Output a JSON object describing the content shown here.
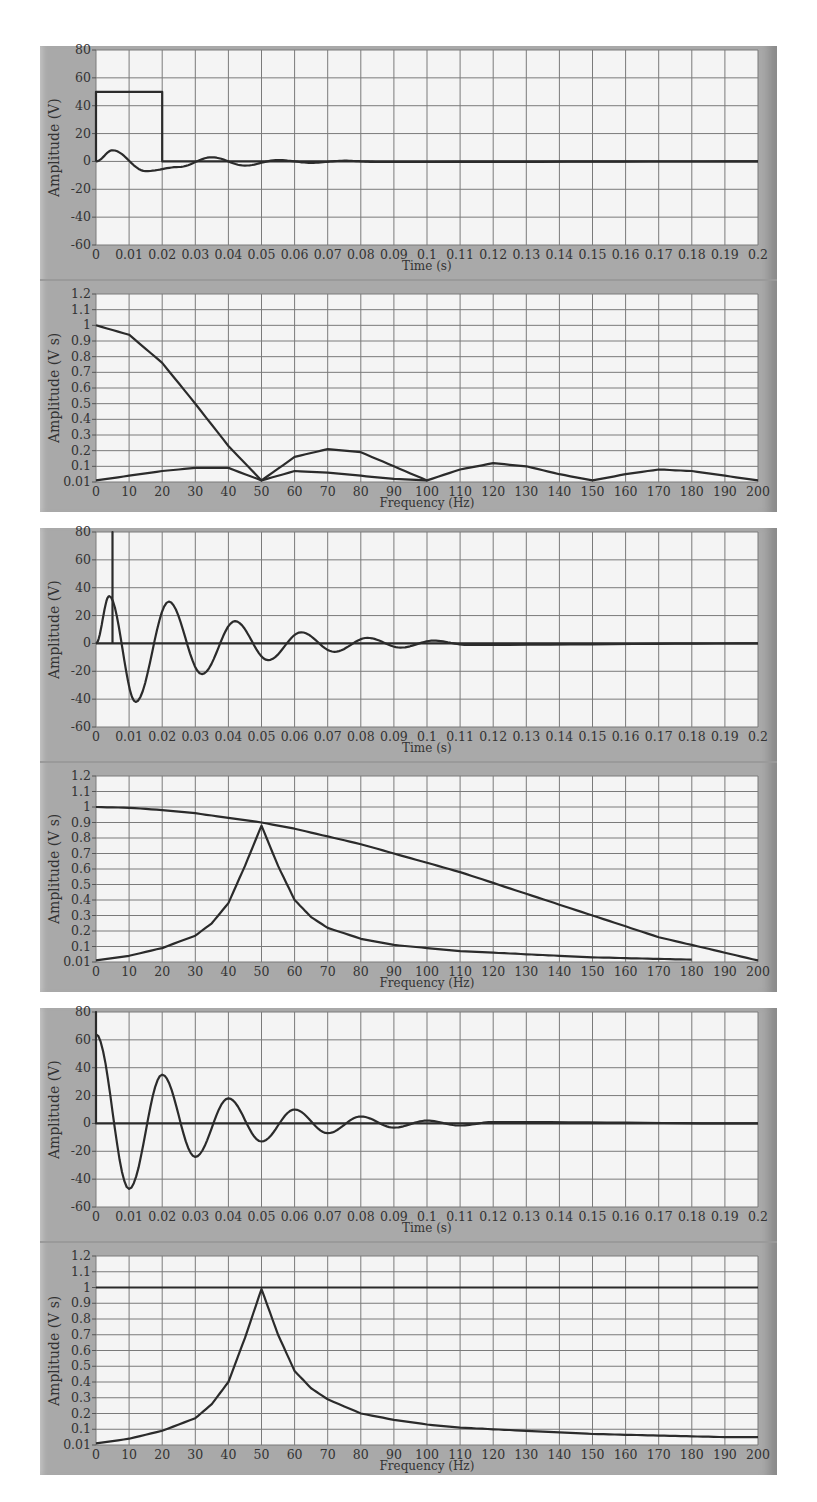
{
  "figure": {
    "panels": [
      {
        "id": "rect-pulse"
      },
      {
        "id": "impulse-response"
      },
      {
        "id": "matched"
      }
    ]
  },
  "chart_data": [
    {
      "type": "line",
      "panel": 1,
      "title": "",
      "xlabel": "Time (s)",
      "ylabel": "Amplitude (V)",
      "xlim": [
        0,
        0.2
      ],
      "ylim": [
        -60,
        80
      ],
      "xticks": [
        "0",
        "0.01",
        "0.02",
        "0.03",
        "0.04",
        "0.05",
        "0.06",
        "0.07",
        "0.08",
        "0.09",
        "0.1",
        "0.11",
        "0.12",
        "0.13",
        "0.14",
        "0.15",
        "0.16",
        "0.17",
        "0.18",
        "0.19",
        "0.2"
      ],
      "yticks": [
        "80",
        "60",
        "40",
        "20",
        "0",
        "-20",
        "-40",
        "-60"
      ],
      "grid": true,
      "series": [
        {
          "name": "rectangular pulse",
          "x": [
            0,
            0,
            0.02,
            0.02,
            0.2
          ],
          "values": [
            0,
            50,
            50,
            0,
            0
          ]
        },
        {
          "name": "decaying oscillation",
          "x": [
            0,
            0.005,
            0.015,
            0.025,
            0.035,
            0.045,
            0.055,
            0.065,
            0.075,
            0.085,
            0.2
          ],
          "values": [
            0,
            8,
            -7,
            -4,
            3,
            -3,
            1,
            -1,
            0.5,
            -0.4,
            0
          ]
        }
      ]
    },
    {
      "type": "line",
      "panel": 1,
      "xlabel": "Frequency (Hz)",
      "ylabel": "Amplitude (V s)",
      "xlim": [
        0,
        200
      ],
      "ylim": [
        0.01,
        1.2
      ],
      "xticks": [
        "0",
        "10",
        "20",
        "30",
        "40",
        "50",
        "60",
        "70",
        "80",
        "90",
        "100",
        "110",
        "120",
        "130",
        "140",
        "150",
        "160",
        "170",
        "180",
        "190",
        "200"
      ],
      "yticks": [
        "1.2",
        "1.1",
        "1",
        "0.9",
        "0.8",
        "0.7",
        "0.6",
        "0.5",
        "0.4",
        "0.3",
        "0.2",
        "0.1",
        "0.01"
      ],
      "grid": true,
      "series": [
        {
          "name": "pulse spectrum |sinc|",
          "x": [
            0,
            10,
            20,
            30,
            40,
            50,
            60,
            70,
            80,
            90,
            100,
            110,
            120,
            130,
            140,
            150,
            160,
            170,
            180,
            190,
            200
          ],
          "values": [
            1,
            0.94,
            0.76,
            0.5,
            0.23,
            0.01,
            0.16,
            0.21,
            0.19,
            0.1,
            0.01,
            0.08,
            0.12,
            0.1,
            0.05,
            0.01,
            0.05,
            0.08,
            0.07,
            0.04,
            0.01
          ]
        },
        {
          "name": "oscillation spectrum",
          "x": [
            0,
            10,
            20,
            30,
            40,
            50,
            60,
            70,
            80,
            90,
            100
          ],
          "values": [
            0.01,
            0.04,
            0.07,
            0.09,
            0.09,
            0.01,
            0.07,
            0.06,
            0.04,
            0.02,
            0.01
          ]
        }
      ]
    },
    {
      "type": "line",
      "panel": 2,
      "xlabel": "Time (s)",
      "ylabel": "Amplitude (V)",
      "xlim": [
        0,
        0.2
      ],
      "ylim": [
        -60,
        80
      ],
      "xticks": [
        "0",
        "0.01",
        "0.02",
        "0.03",
        "0.04",
        "0.05",
        "0.06",
        "0.07",
        "0.08",
        "0.09",
        "0.1",
        "0.11",
        "0.12",
        "0.13",
        "0.14",
        "0.15",
        "0.16",
        "0.17",
        "0.18",
        "0.19",
        "0.2"
      ],
      "yticks": [
        "80",
        "60",
        "40",
        "20",
        "0",
        "-20",
        "-40",
        "-60"
      ],
      "grid": true,
      "series": [
        {
          "name": "short pulse",
          "x": [
            0,
            0.005,
            0.005,
            0.005,
            0.2
          ],
          "values": [
            0,
            0,
            80,
            0,
            0
          ]
        },
        {
          "name": "decaying oscillation",
          "x": [
            0,
            0.004,
            0.012,
            0.022,
            0.032,
            0.042,
            0.052,
            0.062,
            0.072,
            0.082,
            0.092,
            0.102,
            0.112,
            0.2
          ],
          "values": [
            0,
            34,
            -42,
            30,
            -22,
            16,
            -12,
            8,
            -6,
            4,
            -3,
            2,
            -1,
            0
          ]
        }
      ]
    },
    {
      "type": "line",
      "panel": 2,
      "xlabel": "Frequency (Hz)",
      "ylabel": "Amplitude (V s)",
      "xlim": [
        0,
        200
      ],
      "ylim": [
        0.01,
        1.2
      ],
      "xticks": [
        "0",
        "10",
        "20",
        "30",
        "40",
        "50",
        "60",
        "70",
        "80",
        "90",
        "100",
        "110",
        "120",
        "130",
        "140",
        "150",
        "160",
        "170",
        "180",
        "190",
        "200"
      ],
      "yticks": [
        "1.2",
        "1.1",
        "1",
        "0.9",
        "0.8",
        "0.7",
        "0.6",
        "0.5",
        "0.4",
        "0.3",
        "0.2",
        "0.1",
        "0.01"
      ],
      "grid": true,
      "series": [
        {
          "name": "pulse spectrum",
          "x": [
            0,
            10,
            20,
            30,
            40,
            50,
            60,
            70,
            80,
            90,
            100,
            110,
            120,
            130,
            140,
            150,
            160,
            170,
            180,
            190,
            200
          ],
          "values": [
            1,
            0.995,
            0.98,
            0.96,
            0.93,
            0.9,
            0.86,
            0.81,
            0.76,
            0.7,
            0.64,
            0.58,
            0.51,
            0.44,
            0.37,
            0.3,
            0.23,
            0.16,
            0.11,
            0.06,
            0.01
          ]
        },
        {
          "name": "oscillation spectrum",
          "x": [
            0,
            10,
            20,
            30,
            35,
            40,
            45,
            50,
            55,
            60,
            65,
            70,
            80,
            90,
            100,
            110,
            120,
            130,
            140,
            150,
            160,
            170,
            180
          ],
          "values": [
            0.01,
            0.04,
            0.09,
            0.17,
            0.25,
            0.38,
            0.62,
            0.88,
            0.62,
            0.4,
            0.29,
            0.22,
            0.15,
            0.11,
            0.09,
            0.07,
            0.06,
            0.05,
            0.04,
            0.03,
            0.025,
            0.02,
            0.015
          ]
        }
      ]
    },
    {
      "type": "line",
      "panel": 3,
      "xlabel": "Time (s)",
      "ylabel": "Amplitude (V)",
      "xlim": [
        0,
        0.2
      ],
      "ylim": [
        -60,
        80
      ],
      "xticks": [
        "0",
        "0.01",
        "0.02",
        "0.03",
        "0.04",
        "0.05",
        "0.06",
        "0.07",
        "0.08",
        "0.09",
        "0.1",
        "0.11",
        "0.12",
        "0.13",
        "0.14",
        "0.15",
        "0.16",
        "0.17",
        "0.18",
        "0.19",
        "0.2"
      ],
      "yticks": [
        "80",
        "60",
        "40",
        "20",
        "0",
        "-20",
        "-40",
        "-60"
      ],
      "grid": true,
      "series": [
        {
          "name": "impulse",
          "x": [
            0,
            0,
            0,
            0.2
          ],
          "values": [
            0,
            80,
            0,
            0
          ]
        },
        {
          "name": "decaying oscillation",
          "x": [
            0,
            0.01,
            0.02,
            0.03,
            0.04,
            0.05,
            0.06,
            0.07,
            0.08,
            0.09,
            0.1,
            0.11,
            0.12,
            0.2
          ],
          "values": [
            64,
            -47,
            35,
            -24,
            18,
            -13,
            10,
            -7,
            5,
            -3,
            2,
            -1.5,
            1,
            0
          ]
        }
      ]
    },
    {
      "type": "line",
      "panel": 3,
      "xlabel": "Frequency (Hz)",
      "ylabel": "Amplitude (V s)",
      "xlim": [
        0,
        200
      ],
      "ylim": [
        0.01,
        1.2
      ],
      "xticks": [
        "0",
        "10",
        "20",
        "30",
        "40",
        "50",
        "60",
        "70",
        "80",
        "90",
        "100",
        "110",
        "120",
        "130",
        "140",
        "150",
        "160",
        "170",
        "180",
        "190",
        "200"
      ],
      "yticks": [
        "1.2",
        "1.1",
        "1",
        "0.9",
        "0.8",
        "0.7",
        "0.6",
        "0.5",
        "0.4",
        "0.3",
        "0.2",
        "0.1",
        "0.01"
      ],
      "grid": true,
      "series": [
        {
          "name": "flat impulse spectrum",
          "x": [
            0,
            200
          ],
          "values": [
            1,
            1
          ]
        },
        {
          "name": "oscillation spectrum",
          "x": [
            0,
            10,
            20,
            30,
            35,
            40,
            45,
            50,
            55,
            60,
            65,
            70,
            80,
            90,
            100,
            110,
            120,
            130,
            140,
            150,
            160,
            170,
            180,
            190,
            200
          ],
          "values": [
            0.01,
            0.04,
            0.09,
            0.17,
            0.26,
            0.4,
            0.68,
            0.99,
            0.7,
            0.47,
            0.36,
            0.29,
            0.2,
            0.16,
            0.13,
            0.11,
            0.1,
            0.09,
            0.08,
            0.07,
            0.065,
            0.06,
            0.055,
            0.05,
            0.05
          ]
        }
      ]
    }
  ]
}
